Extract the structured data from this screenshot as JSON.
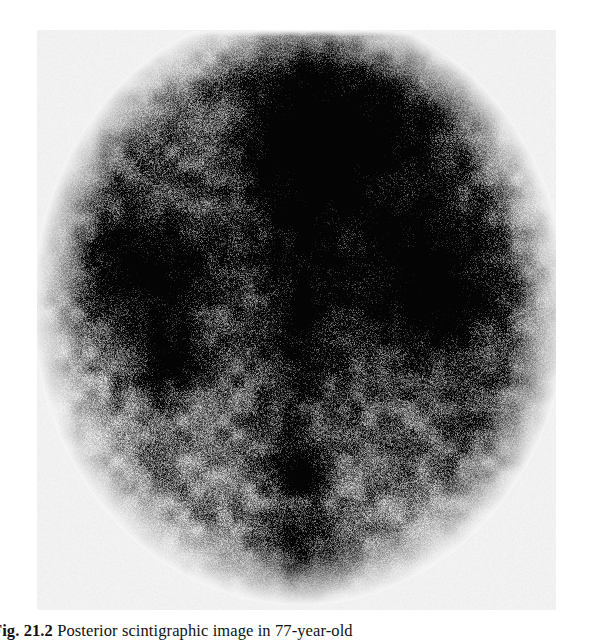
{
  "figure": {
    "kind": "nuclear-medicine-scintigram",
    "modality_label": "scintigraphy",
    "view": "posterior",
    "panel": {
      "x": 37,
      "y": 30,
      "width": 519,
      "height": 580,
      "background_hex": "#efefef",
      "film_border_hex": "#ffffff"
    },
    "appearance": {
      "grain": "coarse photographic halftone noise",
      "tone_light_hex": "#f2f2f2",
      "tone_mid_hex": "#9a9a9a",
      "tone_dark_hex": "#1c1c1c",
      "tone_black_hex": "#0a0a0a"
    },
    "regions": [
      {
        "name": "body-silhouette",
        "cx": 300,
        "cy": 300,
        "rx": 270,
        "ry": 300,
        "intensity": 0.42
      },
      {
        "name": "central-vertical-uptake-band",
        "cx": 300,
        "cy": 130,
        "rx": 78,
        "ry": 125,
        "intensity": 0.92
      },
      {
        "name": "upper-right-field-uptake",
        "cx": 395,
        "cy": 140,
        "rx": 110,
        "ry": 120,
        "intensity": 0.7
      },
      {
        "name": "left-kidney-focus",
        "cx": 142,
        "cy": 268,
        "rx": 80,
        "ry": 62,
        "intensity": 0.95
      },
      {
        "name": "left-lower-focus",
        "cx": 168,
        "cy": 360,
        "rx": 48,
        "ry": 45,
        "intensity": 0.78
      },
      {
        "name": "right-kidney-focus",
        "cx": 432,
        "cy": 288,
        "rx": 92,
        "ry": 80,
        "intensity": 0.93
      },
      {
        "name": "midline-column",
        "cx": 300,
        "cy": 330,
        "rx": 48,
        "ry": 120,
        "intensity": 0.55
      },
      {
        "name": "bladder-focus",
        "cx": 297,
        "cy": 470,
        "rx": 34,
        "ry": 34,
        "intensity": 0.8
      },
      {
        "name": "lower-midline-tail",
        "cx": 300,
        "cy": 560,
        "rx": 60,
        "ry": 55,
        "intensity": 0.62
      },
      {
        "name": "left-background-field",
        "cx": 120,
        "cy": 150,
        "rx": 95,
        "ry": 110,
        "intensity": 0.3
      },
      {
        "name": "right-background-field",
        "cx": 490,
        "cy": 420,
        "rx": 85,
        "ry": 110,
        "intensity": 0.28
      }
    ]
  },
  "caption": {
    "label": "Fig. 21.2",
    "separator": "  ",
    "text": "Posterior scintigraphic image in 77-year-old"
  }
}
